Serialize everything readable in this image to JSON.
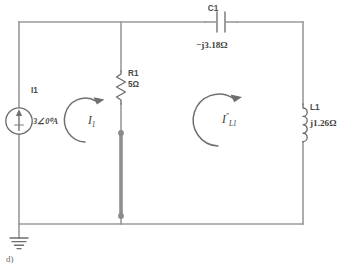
{
  "figure": {
    "caption": "d)",
    "kind": "ac-circuit-schematic"
  },
  "source": {
    "ref": "I1",
    "value": "3∠0⁰A",
    "symbol": "current-source-arrow-up"
  },
  "resistor": {
    "ref": "R1",
    "value": "5Ω"
  },
  "capacitor": {
    "ref": "C1",
    "value": "−j3.18Ω"
  },
  "inductor": {
    "ref": "L1",
    "value": "j1.26Ω"
  },
  "meshes": {
    "left": {
      "symbol": "I",
      "subscript": "1",
      "prime": ""
    },
    "right": {
      "symbol": "I",
      "subscript": "L1",
      "prime": "″"
    }
  },
  "ground": {
    "symbol": "earth-ground"
  },
  "colors": {
    "wire": "#9a9a9a",
    "component": "#6d6d6d",
    "selected_wire": "#8f8f8f",
    "node": "#8a8a8a",
    "text": "#4a4a4a",
    "background": "#ffffff"
  }
}
